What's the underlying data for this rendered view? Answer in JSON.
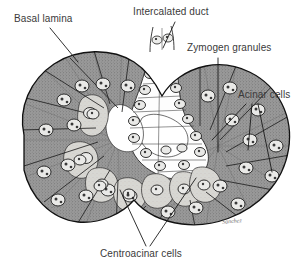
{
  "figure": {
    "background_color": "#ffffff",
    "labels": [
      {
        "id": "basal-lamina",
        "text": "Basal lamina"
      },
      {
        "id": "intercalated-duct",
        "text": "Intercalated duct"
      },
      {
        "id": "zymogen-granules",
        "text": "Zymogen granules"
      },
      {
        "id": "acinar-cells",
        "text": "Acinar cells"
      },
      {
        "id": "centroacinar-cells",
        "text": "Centroacinar cells"
      }
    ],
    "signature": "Sanchez",
    "colors": {
      "outline": "#1a1a1a",
      "acinar_cytoplasm_dark": "#9a9a9a",
      "acinar_cytoplasm_mid": "#ababab",
      "centroacinar_light": "#d8d6d2",
      "duct_lumen_white": "#fdfdfd",
      "nucleus_fill": "#e8e8e6",
      "label_text": "#3a3a3a",
      "leader_line": "#1a1a1a"
    },
    "structures": {
      "acinar_cells": "Pyramidal secretory cells with dark stippled basal cytoplasm and round nuclei, arranged radially around lumina",
      "centroacinar_cells": "Pale wedge-shaped cells at the centre of the acinus, continuous with the intercalated duct",
      "intercalated_duct": "Narrow pale duct at top centre leading out of the acinus",
      "zymogen_granules": "Apical stippling in acinar cytoplasm",
      "basal_lamina": "Thin outer boundary line enclosing the acinus"
    }
  }
}
